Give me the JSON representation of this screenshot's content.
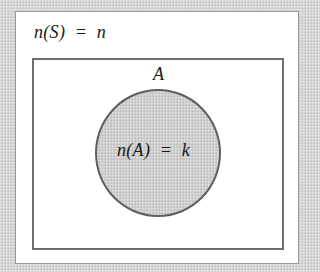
{
  "diagram": {
    "type": "venn",
    "universe": {
      "label": "n(S)  =  n"
    },
    "set": {
      "name": "A",
      "count_label": "n(A)  =  k"
    },
    "colors": {
      "background": "#d6d6d6",
      "frame": "#ffffff",
      "universe_border": "#6e6e6e",
      "set_fill": "#cfcfcf",
      "set_border": "#5e5e5e",
      "text": "#1a1a1a"
    }
  }
}
